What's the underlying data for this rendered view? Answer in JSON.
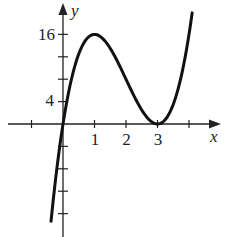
{
  "chart_data": {
    "type": "line",
    "title": "",
    "function": "f(x) = 4x(x-3)^2",
    "xlabel": "x",
    "ylabel": "y",
    "x_tick_values": [
      -1,
      1,
      2,
      3,
      4
    ],
    "x_tick_labels": [
      "1",
      "2",
      "3"
    ],
    "y_tick_values": [
      -16,
      -12,
      -8,
      -4,
      4,
      8,
      12,
      16
    ],
    "y_tick_labels": [
      "4",
      "16"
    ],
    "xlim": [
      -2,
      4.6
    ],
    "ylim": [
      -20,
      19
    ],
    "grid": false,
    "x": [
      -0.38,
      -0.25,
      0,
      0.25,
      0.5,
      0.75,
      1,
      1.25,
      1.5,
      1.75,
      2,
      2.25,
      2.5,
      2.75,
      3,
      3.25,
      3.5,
      3.75,
      4,
      4.1
    ],
    "y": [
      -17.2,
      -11.6,
      0,
      7.6,
      12.5,
      15.2,
      16,
      15.3,
      13.5,
      10.9,
      8,
      5.1,
      2.5,
      0.7,
      0,
      0.8,
      3.5,
      8.4,
      16,
      19
    ],
    "key_points": [
      {
        "label": "local max",
        "x": 1,
        "y": 16
      },
      {
        "label": "local min",
        "x": 3,
        "y": 0
      },
      {
        "label": "origin",
        "x": 0,
        "y": 0
      }
    ]
  },
  "labels": {
    "x_axis": "x",
    "y_axis": "y",
    "x1": "1",
    "x2": "2",
    "x3": "3",
    "y4": "4",
    "y16": "16"
  }
}
